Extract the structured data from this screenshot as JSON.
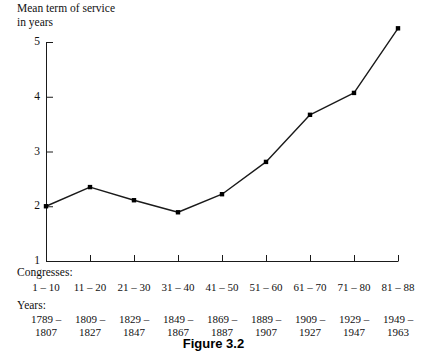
{
  "caption": "Figure 3.2",
  "axis_title": "Mean term of service\nin years",
  "row_headings": {
    "congresses": "Congresses:",
    "years": "Years:"
  },
  "y_ticks": [
    "1",
    "2",
    "3",
    "4",
    "5"
  ],
  "chart_data": {
    "type": "line",
    "title": "Figure 3.2",
    "xlabel": "Congresses",
    "ylabel": "Mean term of service in years",
    "categories": [
      "1 – 10",
      "11 – 20",
      "21 – 30",
      "31 – 40",
      "41 – 50",
      "51 – 60",
      "61 – 70",
      "71 – 80",
      "81 – 88"
    ],
    "category_years": [
      "1789 –\n1807",
      "1809 –\n1827",
      "1829 –\n1847",
      "1849 –\n1867",
      "1869 –\n1887",
      "1889 –\n1907",
      "1909 –\n1927",
      "1929 –\n1947",
      "1949 –\n1963"
    ],
    "values": [
      2.0,
      2.35,
      2.11,
      1.89,
      2.22,
      2.81,
      3.67,
      4.07,
      5.25
    ],
    "ylim": [
      1,
      5
    ],
    "yticks": [
      1,
      2,
      3,
      4,
      5
    ],
    "grid": false,
    "legend": null,
    "marker": "filled-square",
    "line_color": "#1a1a1a",
    "marker_color": "#000000"
  }
}
